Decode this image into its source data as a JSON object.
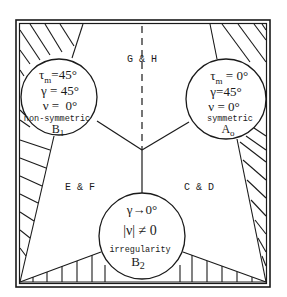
{
  "diagram": {
    "colors": {
      "ink": "#1a1a1a",
      "background": "#ffffff"
    },
    "regions": {
      "top": {
        "label": "G & H"
      },
      "left": {
        "label": "E & F"
      },
      "right": {
        "label": "C & D"
      }
    },
    "nodes": {
      "B1": {
        "line1": "τm=45°",
        "tau_symbol": "τ",
        "tau_sub": "m",
        "tau_val": "=45°",
        "line2": "γ = 45°",
        "line3": "ν =  0°",
        "caption": "non-symmetric",
        "name": "B",
        "name_sub": "1"
      },
      "A0": {
        "tau_symbol": "τ",
        "tau_sub": "m",
        "tau_val": " = 0°",
        "line2": "γ=45°",
        "line3": "ν = 0°",
        "caption": "symmetric",
        "name": "A",
        "name_sub": "o"
      },
      "B2": {
        "line1": "γ→0°",
        "line2": "|ν| ≠ 0",
        "caption": "irregularity",
        "name": "B",
        "name_sub": "2"
      }
    }
  }
}
